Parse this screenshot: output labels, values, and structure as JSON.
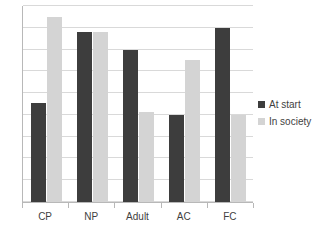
{
  "chart_data": {
    "type": "bar",
    "title": "",
    "subtitle": "",
    "xlabel": "",
    "ylabel": "",
    "categories": [
      "CP",
      "NP",
      "Adult",
      "AC",
      "FC"
    ],
    "series": [
      {
        "name": "At start",
        "color": "#3d3d3d",
        "values": [
          4.55,
          7.8,
          7.0,
          4.0,
          8.0
        ]
      },
      {
        "name": "In society",
        "color": "#d4d4d4",
        "values": [
          8.5,
          7.8,
          4.15,
          6.5,
          4.0
        ]
      }
    ],
    "ylim": [
      0,
      9
    ],
    "y_tick_labels": [],
    "y_gridline_values": [
      0,
      1,
      2,
      3,
      4,
      5,
      6,
      7,
      8,
      9
    ],
    "grid": true,
    "legend_position": "right",
    "annotations": []
  },
  "legend": {
    "items": [
      {
        "label": "At start",
        "swatch": "dark-square-icon"
      },
      {
        "label": "In society",
        "swatch": "light-square-icon"
      }
    ]
  },
  "axes": {
    "x_labels": [
      "CP",
      "NP",
      "Adult",
      "AC",
      "FC"
    ]
  }
}
